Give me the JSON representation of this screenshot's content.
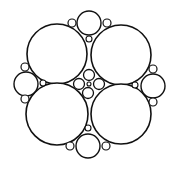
{
  "diagram": {
    "type": "circle-packing",
    "stroke_color": "#111111",
    "background": "#ffffff",
    "circles": [
      {
        "name": "large-circle-top-left",
        "cx": 57,
        "cy": 54,
        "r": 30,
        "sw": 1.6
      },
      {
        "name": "large-circle-top-right",
        "cx": 121,
        "cy": 55,
        "r": 30,
        "sw": 1.6
      },
      {
        "name": "large-circle-bottom-left",
        "cx": 57,
        "cy": 114,
        "r": 31,
        "sw": 1.6
      },
      {
        "name": "large-circle-bottom-right",
        "cx": 121,
        "cy": 114,
        "r": 30,
        "sw": 1.6
      },
      {
        "name": "medium-circle-top",
        "cx": 89,
        "cy": 23,
        "r": 12,
        "sw": 1.4
      },
      {
        "name": "medium-circle-bottom",
        "cx": 88,
        "cy": 146,
        "r": 12,
        "sw": 1.4
      },
      {
        "name": "medium-circle-left",
        "cx": 26,
        "cy": 84,
        "r": 12,
        "sw": 1.4
      },
      {
        "name": "medium-circle-right",
        "cx": 153,
        "cy": 86,
        "r": 12,
        "sw": 1.4
      },
      {
        "name": "center-circle-top",
        "cx": 89,
        "cy": 75,
        "r": 5.5,
        "sw": 1.3
      },
      {
        "name": "center-circle-left",
        "cx": 79,
        "cy": 84,
        "r": 5.5,
        "sw": 1.3
      },
      {
        "name": "center-circle-right",
        "cx": 99,
        "cy": 84,
        "r": 5.5,
        "sw": 1.3
      },
      {
        "name": "center-circle-bottom",
        "cx": 88,
        "cy": 93,
        "r": 5.5,
        "sw": 1.3
      },
      {
        "name": "center-circle-tiny",
        "cx": 89,
        "cy": 84,
        "r": 2,
        "sw": 1.1
      },
      {
        "name": "small-circle-top-left",
        "cx": 72,
        "cy": 23,
        "r": 4,
        "sw": 1.2
      },
      {
        "name": "small-circle-top-right",
        "cx": 107,
        "cy": 23,
        "r": 4,
        "sw": 1.2
      },
      {
        "name": "small-circle-left-top",
        "cx": 25,
        "cy": 67,
        "r": 4,
        "sw": 1.2
      },
      {
        "name": "small-circle-left-bottom",
        "cx": 25,
        "cy": 99,
        "r": 4,
        "sw": 1.2
      },
      {
        "name": "small-circle-right-top",
        "cx": 153,
        "cy": 69,
        "r": 4,
        "sw": 1.2
      },
      {
        "name": "small-circle-right-bottom",
        "cx": 153,
        "cy": 102,
        "r": 4,
        "sw": 1.2
      },
      {
        "name": "small-circle-bottom-left",
        "cx": 70,
        "cy": 146,
        "r": 4,
        "sw": 1.2
      },
      {
        "name": "small-circle-bottom-right",
        "cx": 106,
        "cy": 146,
        "r": 4,
        "sw": 1.2
      },
      {
        "name": "tiny-circle-top",
        "cx": 89,
        "cy": 39,
        "r": 3,
        "sw": 1.1
      },
      {
        "name": "tiny-circle-bottom",
        "cx": 88,
        "cy": 128,
        "r": 3,
        "sw": 1.1
      },
      {
        "name": "tiny-circle-left",
        "cx": 43,
        "cy": 83,
        "r": 3,
        "sw": 1.1
      },
      {
        "name": "tiny-circle-right",
        "cx": 135,
        "cy": 85,
        "r": 3,
        "sw": 1.1
      }
    ]
  }
}
